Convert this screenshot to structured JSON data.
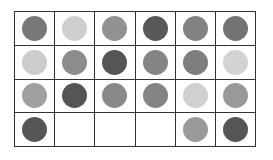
{
  "grid": {
    "rows": 4,
    "cols": 6,
    "palette": {
      "dark": "#555555",
      "medium_dark": "#777777",
      "medium": "#8e8e8e",
      "medium_light": "#a0a0a0",
      "light": "#d0d0d0",
      "empty": null
    },
    "cells": [
      [
        "#787878",
        "#cfcfcf",
        "#929292",
        "#585858",
        "#828282",
        "#737373"
      ],
      [
        "#cccccc",
        "#8c8c8c",
        "#555555",
        "#858585",
        "#7e7e7e",
        "#d3d3d3"
      ],
      [
        "#a0a0a0",
        "#555555",
        "#898989",
        "#848484",
        "#d0d0d0",
        "#999999"
      ],
      [
        "#565656",
        null,
        null,
        null,
        "#9a9a9a",
        "#555555"
      ]
    ]
  }
}
